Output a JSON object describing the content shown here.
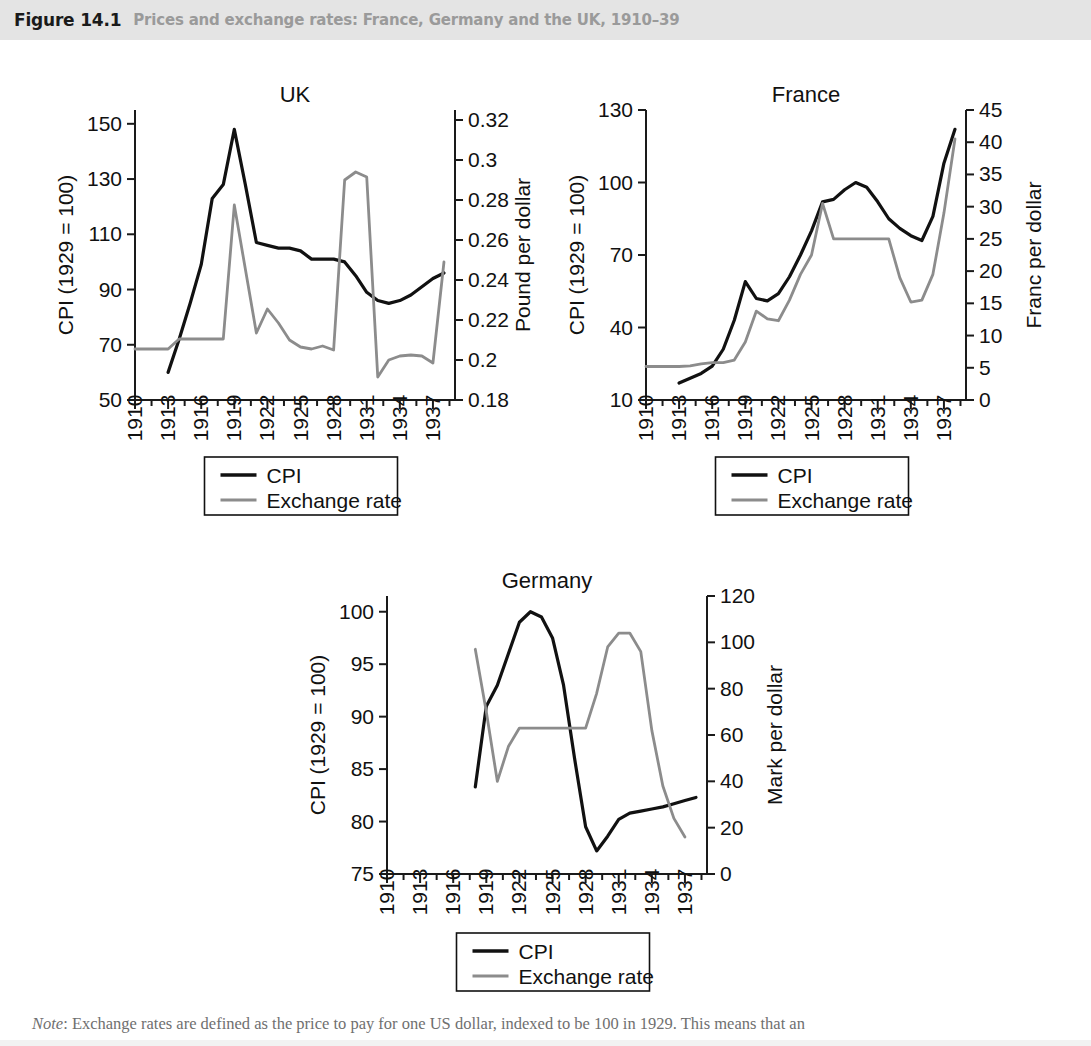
{
  "header": {
    "figure_number": "Figure 14.1",
    "title": "Prices and exchange rates: France, Germany and the UK, 1910–39",
    "bg_color": "#e4e4e4",
    "number_color": "#1a1a1a",
    "title_color": "#9a9a9a"
  },
  "note": {
    "lead": "Note",
    "text": ": Exchange rates are defined as the price to pay for one US dollar, indexed to be 100 in 1929. This means that an"
  },
  "legend": {
    "cpi_label": "CPI",
    "fx_label": "Exchange rate",
    "cpi_color": "#111111",
    "fx_color": "#8c8c8c"
  },
  "chart_data": [
    {
      "id": "uk",
      "type": "line",
      "title": "UK",
      "xlabel": "",
      "ylabel": "CPI (1929 = 100)",
      "y2label": "Pound per dollar",
      "xlim": [
        1910,
        1939
      ],
      "ylim": [
        50,
        155
      ],
      "y2lim": [
        0.18,
        0.325
      ],
      "yticks": [
        50,
        70,
        90,
        110,
        130,
        150
      ],
      "y2ticks": [
        0.18,
        0.2,
        0.22,
        0.24,
        0.26,
        0.28,
        0.3,
        0.32
      ],
      "y2ticklabels": [
        "0.18",
        "0.2",
        "0.22",
        "0.24",
        "0.26",
        "0.28",
        "0.3",
        "0.32"
      ],
      "xticks": [
        1910,
        1913,
        1916,
        1919,
        1922,
        1925,
        1928,
        1931,
        1934,
        1937
      ],
      "grid": false,
      "legend_position": "below",
      "series": [
        {
          "name": "CPI",
          "axis": "left",
          "color": "#111111",
          "x": [
            1913,
            1914,
            1915,
            1916,
            1917,
            1918,
            1919,
            1920,
            1921,
            1922,
            1923,
            1924,
            1925,
            1926,
            1927,
            1928,
            1929,
            1930,
            1931,
            1932,
            1933,
            1934,
            1935,
            1936,
            1937,
            1938
          ],
          "y": [
            60,
            72,
            85,
            99,
            123,
            128,
            148,
            128,
            107,
            106,
            105,
            105,
            104,
            101,
            101,
            101,
            100,
            95,
            89,
            86,
            85,
            86,
            88,
            91,
            94,
            96
          ]
        },
        {
          "name": "Exchange rate",
          "axis": "right",
          "color": "#8c8c8c",
          "x": [
            1910,
            1911,
            1912,
            1913,
            1914,
            1915,
            1916,
            1917,
            1918,
            1919,
            1920,
            1921,
            1922,
            1923,
            1924,
            1925,
            1926,
            1927,
            1928,
            1929,
            1930,
            1931,
            1932,
            1933,
            1934,
            1935,
            1936,
            1937,
            1938
          ],
          "y": [
            0.2055,
            0.2055,
            0.2055,
            0.2055,
            0.2105,
            0.2105,
            0.2105,
            0.2105,
            0.2105,
            0.2775,
            0.2455,
            0.2135,
            0.2255,
            0.2185,
            0.21,
            0.2065,
            0.2055,
            0.207,
            0.205,
            0.29,
            0.294,
            0.2915,
            0.1915,
            0.2,
            0.202,
            0.2025,
            0.202,
            0.1985,
            0.249
          ]
        }
      ]
    },
    {
      "id": "france",
      "type": "line",
      "title": "France",
      "xlabel": "",
      "ylabel": "CPI (1929 = 100)",
      "y2label": "Franc per dollar",
      "xlim": [
        1910,
        1939
      ],
      "ylim": [
        10,
        130
      ],
      "y2lim": [
        0,
        45
      ],
      "yticks": [
        10,
        40,
        70,
        100,
        130
      ],
      "y2ticks": [
        0,
        5,
        10,
        15,
        20,
        25,
        30,
        35,
        40,
        45
      ],
      "xticks": [
        1910,
        1913,
        1916,
        1919,
        1922,
        1925,
        1928,
        1931,
        1934,
        1937
      ],
      "grid": false,
      "legend_position": "below",
      "series": [
        {
          "name": "CPI",
          "axis": "left",
          "color": "#111111",
          "x": [
            1913,
            1914,
            1915,
            1916,
            1917,
            1918,
            1919,
            1920,
            1921,
            1922,
            1923,
            1924,
            1925,
            1926,
            1927,
            1928,
            1929,
            1930,
            1931,
            1932,
            1933,
            1934,
            1935,
            1936,
            1937,
            1938
          ],
          "y": [
            17,
            19,
            21,
            24,
            31,
            43,
            59,
            52,
            51,
            54,
            61,
            70,
            80,
            92,
            93,
            97,
            100,
            98,
            92,
            85,
            81,
            78,
            76,
            86,
            108,
            122
          ]
        },
        {
          "name": "Exchange rate",
          "axis": "right",
          "color": "#8c8c8c",
          "x": [
            1910,
            1911,
            1912,
            1913,
            1914,
            1915,
            1916,
            1917,
            1918,
            1919,
            1920,
            1921,
            1922,
            1923,
            1924,
            1925,
            1926,
            1927,
            1928,
            1929,
            1930,
            1931,
            1932,
            1933,
            1934,
            1935,
            1936,
            1937,
            1938
          ],
          "y": [
            5.2,
            5.2,
            5.2,
            5.2,
            5.3,
            5.6,
            5.8,
            5.8,
            6.2,
            9.0,
            13.8,
            12.6,
            12.3,
            15.5,
            19.5,
            22.5,
            30.5,
            25.0,
            25.0,
            25.0,
            25.0,
            25.0,
            25.0,
            19.0,
            15.2,
            15.5,
            19.5,
            29.0,
            40.5
          ]
        }
      ]
    },
    {
      "id": "germany",
      "type": "line",
      "title": "Germany",
      "xlabel": "",
      "ylabel": "CPI (1929 = 100)",
      "y2label": "Mark per dollar",
      "xlim": [
        1910,
        1939
      ],
      "ylim": [
        75,
        101.5
      ],
      "y2lim": [
        0,
        120
      ],
      "yticks": [
        75,
        80,
        85,
        90,
        95,
        100
      ],
      "y2ticks": [
        0,
        20,
        40,
        60,
        80,
        100,
        120
      ],
      "xticks": [
        1910,
        1913,
        1916,
        1919,
        1922,
        1925,
        1928,
        1931,
        1934,
        1937
      ],
      "grid": false,
      "legend_position": "below",
      "series": [
        {
          "name": "CPI",
          "axis": "left",
          "color": "#111111",
          "x": [
            1918,
            1919,
            1920,
            1921,
            1922,
            1923,
            1924,
            1925,
            1926,
            1927,
            1928,
            1929,
            1930,
            1931,
            1932,
            1933,
            1934,
            1935,
            1936,
            1937,
            1938
          ],
          "y": [
            83.3,
            91.0,
            93.0,
            96.0,
            99.0,
            100.0,
            99.5,
            97.5,
            93.0,
            86.0,
            79.5,
            77.2,
            78.6,
            80.2,
            80.8,
            81.0,
            81.2,
            81.4,
            81.7,
            82.0,
            82.3
          ]
        },
        {
          "name": "Exchange rate",
          "axis": "right",
          "color": "#8c8c8c",
          "x": [
            1918,
            1919,
            1920,
            1921,
            1922,
            1923,
            1924,
            1925,
            1926,
            1927,
            1928,
            1929,
            1930,
            1931,
            1932,
            1933,
            1934,
            1935,
            1936,
            1937
          ],
          "y": [
            97,
            70,
            40,
            55,
            63,
            63,
            63,
            63,
            63,
            63,
            63,
            78,
            98,
            104,
            104,
            96,
            62,
            38,
            24,
            16
          ]
        }
      ]
    }
  ]
}
